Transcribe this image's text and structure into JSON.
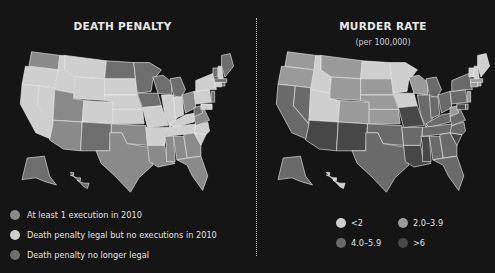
{
  "chart_data": [
    {
      "type": "heatmap",
      "subtype": "choropleth",
      "title": "DEATH PENALTY",
      "legend": [
        {
          "key": "exec",
          "label": "At least 1 execution in 2010",
          "color": "#8a8a8a"
        },
        {
          "key": "legal",
          "label": "Death penalty legal but no executions in 2010",
          "color": "#cfcfcf"
        },
        {
          "key": "none",
          "label": "Death penalty no longer legal",
          "color": "#6e6e6e"
        }
      ],
      "legend_position": "bottom-left",
      "states": {
        "WA": "exec",
        "OR": "legal",
        "CA": "legal",
        "NV": "legal",
        "ID": "legal",
        "MT": "legal",
        "WY": "legal",
        "UT": "exec",
        "AZ": "exec",
        "CO": "legal",
        "NM": "none",
        "ND": "none",
        "SD": "legal",
        "NE": "legal",
        "KS": "legal",
        "OK": "exec",
        "TX": "exec",
        "MN": "none",
        "IA": "none",
        "MO": "legal",
        "AR": "legal",
        "LA": "exec",
        "WI": "none",
        "IL": "legal",
        "MI": "none",
        "IN": "legal",
        "OH": "exec",
        "KY": "legal",
        "TN": "legal",
        "MS": "exec",
        "AL": "exec",
        "GA": "exec",
        "FL": "exec",
        "SC": "legal",
        "NC": "legal",
        "VA": "exec",
        "WV": "none",
        "PA": "legal",
        "NY": "legal",
        "VT": "none",
        "NH": "legal",
        "ME": "none",
        "MA": "none",
        "CT": "legal",
        "RI": "none",
        "NJ": "none",
        "DE": "legal",
        "MD": "legal",
        "AK": "none",
        "HI": "none"
      }
    },
    {
      "type": "heatmap",
      "subtype": "choropleth",
      "title": "MURDER RATE",
      "subtitle": "(per 100,000)",
      "legend": [
        {
          "key": "lt2",
          "label": "<2",
          "color": "#cfcfcf"
        },
        {
          "key": "2to4",
          "label": "2.0–3.9",
          "color": "#9a9a9a"
        },
        {
          "key": "4to6",
          "label": "4.0–5.9",
          "color": "#6a6a6a"
        },
        {
          "key": "gt6",
          "label": ">6",
          "color": "#474747"
        }
      ],
      "legend_position": "bottom",
      "states": {
        "WA": "2to4",
        "OR": "2to4",
        "CA": "4to6",
        "NV": "4to6",
        "ID": "lt2",
        "MT": "2to4",
        "WY": "2to4",
        "UT": "lt2",
        "AZ": "gt6",
        "CO": "2to4",
        "NM": "gt6",
        "ND": "lt2",
        "SD": "2to4",
        "NE": "2to4",
        "KS": "2to4",
        "OK": "4to6",
        "TX": "4to6",
        "MN": "lt2",
        "IA": "lt2",
        "MO": "gt6",
        "AR": "4to6",
        "LA": "gt6",
        "WI": "2to4",
        "IL": "4to6",
        "MI": "4to6",
        "IN": "4to6",
        "OH": "4to6",
        "KY": "4to6",
        "TN": "4to6",
        "MS": "gt6",
        "AL": "4to6",
        "GA": "4to6",
        "FL": "4to6",
        "SC": "gt6",
        "NC": "4to6",
        "VA": "4to6",
        "WV": "2to4",
        "PA": "4to6",
        "NY": "4to6",
        "VT": "lt2",
        "NH": "lt2",
        "ME": "lt2",
        "MA": "2to4",
        "CT": "2to4",
        "RI": "2to4",
        "NJ": "2to4",
        "DE": "4to6",
        "MD": "gt6",
        "AK": "4to6",
        "HI": "lt2"
      }
    }
  ],
  "left": {
    "title": "DEATH PENALTY",
    "legend": [
      {
        "label": "At least 1 execution in 2010",
        "color": "#8a8a8a"
      },
      {
        "label": "Death penalty legal but no executions in 2010",
        "color": "#cfcfcf"
      },
      {
        "label": "Death penalty no longer legal",
        "color": "#6e6e6e"
      }
    ]
  },
  "right": {
    "title": "MURDER RATE",
    "subtitle": "(per 100,000)",
    "legend": [
      {
        "label": "<2",
        "color": "#cfcfcf"
      },
      {
        "label": "2.0–3.9",
        "color": "#9a9a9a"
      },
      {
        "label": "4.0–5.9",
        "color": "#6a6a6a"
      },
      {
        "label": ">6",
        "color": "#474747"
      }
    ]
  }
}
